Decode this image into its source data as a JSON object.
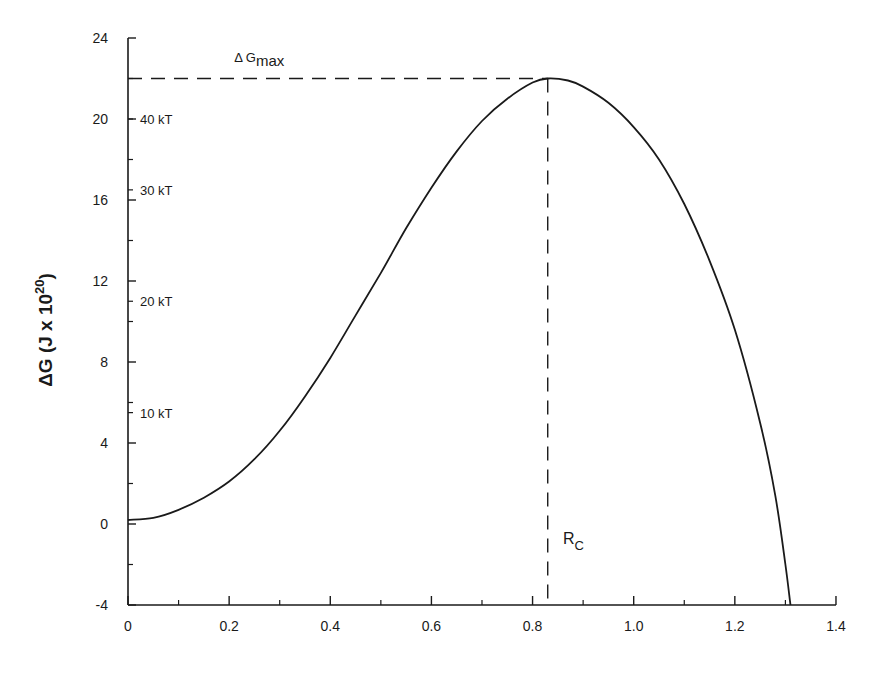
{
  "chart_data": {
    "type": "line",
    "title": "",
    "xlabel": "",
    "ylabel": "ΔG  (J x 10",
    "ylabel_superscript": "20",
    "ylabel_suffix": ")",
    "xlim": [
      0,
      1.4
    ],
    "ylim": [
      -4,
      24
    ],
    "grid": false,
    "legend": null,
    "x_ticks": [
      "0",
      "0.2",
      "0.4",
      "0.6",
      "0.8",
      "1.0",
      "1.2",
      "1.4"
    ],
    "x_tick_values": [
      0,
      0.2,
      0.4,
      0.6,
      0.8,
      1.0,
      1.2,
      1.4
    ],
    "y_ticks": [
      "-4",
      "0",
      "4",
      "8",
      "12",
      "16",
      "20",
      "24"
    ],
    "y_tick_values": [
      -4,
      0,
      4,
      8,
      12,
      16,
      20,
      24
    ],
    "secondary_y_labels": [
      {
        "label": "10 kT",
        "value": 5.5
      },
      {
        "label": "20 kT",
        "value": 11.0
      },
      {
        "label": "30 kT",
        "value": 16.5
      },
      {
        "label": "40 kT",
        "value": 20.0
      }
    ],
    "series": [
      {
        "name": "ΔG",
        "color": "#1a1a1a",
        "x": [
          0,
          0.05,
          0.1,
          0.15,
          0.2,
          0.25,
          0.3,
          0.35,
          0.4,
          0.45,
          0.5,
          0.55,
          0.6,
          0.65,
          0.7,
          0.75,
          0.8,
          0.83,
          0.87,
          0.9,
          0.95,
          1.0,
          1.05,
          1.1,
          1.15,
          1.2,
          1.25,
          1.28,
          1.3,
          1.31
        ],
        "y": [
          0.2,
          0.3,
          0.7,
          1.3,
          2.1,
          3.2,
          4.6,
          6.3,
          8.2,
          10.3,
          12.4,
          14.6,
          16.6,
          18.4,
          19.9,
          21.0,
          21.8,
          22.0,
          21.9,
          21.6,
          20.8,
          19.6,
          18.0,
          15.8,
          13.0,
          9.6,
          5.0,
          1.4,
          -2.0,
          -4.0
        ]
      }
    ],
    "annotations": [
      {
        "text": "Δ G",
        "subscript": "max",
        "x": 0.21,
        "y": 22.8
      },
      {
        "text": "R",
        "subscript": "C",
        "x": 0.86,
        "y": -1.0
      }
    ],
    "reference_lines": [
      {
        "type": "horizontal",
        "y": 22.0,
        "x_from": 0,
        "x_to": 0.83,
        "style": "dashed",
        "label": "ΔGmax"
      },
      {
        "type": "vertical",
        "x": 0.83,
        "y_from": -4,
        "y_to": 22.0,
        "style": "dashed",
        "label": "Rc"
      }
    ]
  }
}
